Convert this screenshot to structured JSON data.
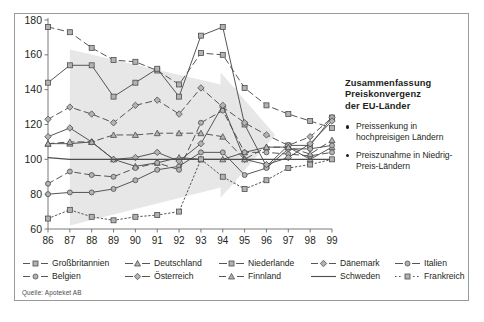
{
  "figure": {
    "source_note": "Quelle: Apoteket AB"
  },
  "sidepanel": {
    "title": "Zusammenfassung Preiskonvergenz der EU-Länder",
    "title_lines": [
      "Zusammenfassung",
      "Preiskonvergenz",
      "der EU-Länder"
    ],
    "bullets": [
      "Preissenkung in hochpreisigen Ländern",
      "Preiszunahme in Niedrig-Preis-Ländern"
    ]
  },
  "chart_data": {
    "type": "line",
    "title": "",
    "xlabel": "",
    "ylabel": "",
    "x": [
      "86",
      "87",
      "88",
      "89",
      "90",
      "91",
      "92",
      "93",
      "94",
      "95",
      "96",
      "97",
      "98",
      "99"
    ],
    "xlim": [
      0,
      13
    ],
    "ylim": [
      60,
      180
    ],
    "yticks": [
      60,
      80,
      100,
      120,
      140,
      160,
      180
    ],
    "ytick_labels": [
      "60",
      "80",
      "100",
      "120",
      "140",
      "160",
      "180"
    ],
    "grid": false,
    "legend_position": "bottom",
    "series": [
      {
        "name": "Großbritannien",
        "marker": "square",
        "dash": "6,4",
        "values": [
          176,
          173,
          164,
          157,
          156,
          151,
          143,
          161,
          160,
          141,
          131,
          126,
          122,
          118
        ]
      },
      {
        "name": "Deutschland",
        "marker": "triangle",
        "dash": "",
        "values": [
          109,
          109,
          110,
          100,
          96,
          98,
          101,
          100,
          100,
          104,
          107,
          107,
          100,
          107
        ]
      },
      {
        "name": "Niederlande",
        "marker": "square",
        "dash": "",
        "values": [
          144,
          154,
          154,
          136,
          144,
          152,
          136,
          171,
          176,
          120,
          96,
          108,
          108,
          124
        ]
      },
      {
        "name": "Dänemark",
        "marker": "diamond",
        "dash": "6,4",
        "values": [
          123,
          130,
          126,
          121,
          131,
          134,
          126,
          141,
          130,
          121,
          114,
          108,
          113,
          124
        ]
      },
      {
        "name": "Italien",
        "marker": "circle",
        "dash": "",
        "values": [
          80,
          81,
          81,
          83,
          88,
          94,
          96,
          104,
          104,
          91,
          95,
          106,
          106,
          108
        ]
      },
      {
        "name": "Belgien",
        "marker": "circle",
        "dash": "6,4",
        "values": [
          86,
          93,
          91,
          90,
          95,
          98,
          94,
          121,
          128,
          104,
          104,
          103,
          102,
          104
        ]
      },
      {
        "name": "Österreich",
        "marker": "diamond",
        "dash": "",
        "values": [
          113,
          118,
          110,
          100,
          101,
          104,
          99,
          109,
          131,
          100,
          97,
          101,
          109,
          122
        ]
      },
      {
        "name": "Finnland",
        "marker": "triangle",
        "dash": "6,4",
        "values": [
          109,
          110,
          110,
          114,
          114,
          115,
          115,
          115,
          113,
          100,
          107,
          107,
          103,
          111
        ]
      },
      {
        "name": "Schweden",
        "marker": "none",
        "dash": "",
        "values": [
          101,
          100,
          100,
          100,
          100,
          100,
          100,
          100,
          100,
          100,
          100,
          100,
          100,
          100
        ]
      },
      {
        "name": "Frankreich",
        "marker": "square",
        "dash": "1.6,2.4",
        "values": [
          66,
          71,
          67,
          65,
          67,
          68,
          70,
          100,
          90,
          83,
          88,
          95,
          97,
          100
        ]
      }
    ]
  },
  "legend": {
    "rows": [
      [
        {
          "label": "Großbritannien",
          "marker": "square",
          "dash": "6,4"
        },
        {
          "label": "Deutschland",
          "marker": "triangle",
          "dash": ""
        },
        {
          "label": "Niederlande",
          "marker": "square",
          "dash": ""
        },
        {
          "label": "Dänemark",
          "marker": "diamond",
          "dash": "6,4"
        },
        {
          "label": "Italien",
          "marker": "circle",
          "dash": ""
        }
      ],
      [
        {
          "label": "Belgien",
          "marker": "circle",
          "dash": "6,4"
        },
        {
          "label": "Österreich",
          "marker": "diamond",
          "dash": ""
        },
        {
          "label": "Finnland",
          "marker": "triangle",
          "dash": "6,4"
        },
        {
          "label": "Schweden",
          "marker": "none",
          "dash": ""
        },
        {
          "label": "Frankreich",
          "marker": "square",
          "dash": "1.6,2.4"
        }
      ]
    ]
  },
  "colors": {
    "line": "#4d4d4d",
    "marker_fill": "#b3b3b3",
    "axis": "#6b6b6b",
    "band": "#e6e6e6",
    "frame": "#9a9a9a",
    "text": "#231f20"
  }
}
